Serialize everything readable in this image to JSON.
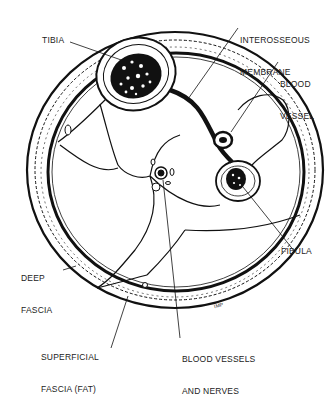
{
  "diagram": {
    "labels": {
      "tibia": "TIBIA",
      "interosseous_membrane_1": "INTEROSSEOUS",
      "interosseous_membrane_2": "MEMBRANE",
      "blood_vessel_1": "BLOOD",
      "blood_vessel_2": "VESSEL",
      "fibula": "FIBULA",
      "deep_fascia_1": "DEEP",
      "deep_fascia_2": "FASCIA",
      "superficial_fascia_1": "SUPERFICIAL",
      "superficial_fascia_2": "FASCIA (FAT)",
      "blood_vessels_nerves_1": "BLOOD VESSELS",
      "blood_vessels_nerves_2": "AND NERVES",
      "signature": "IMP"
    },
    "colors": {
      "ink": "#111111",
      "paper": "#ffffff"
    }
  }
}
